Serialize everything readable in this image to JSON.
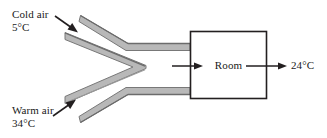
{
  "diagram": {
    "background_color": "#ffffff",
    "line_color": "#231f20",
    "duct_fill_color": "#b3b3b3",
    "duct_edge_color": "#6e6e6e",
    "labels": {
      "cold_air_name": "Cold air",
      "cold_air_temp": "5°C",
      "warm_air_name": "Warm air",
      "warm_air_temp": "34°C",
      "room": "Room",
      "outlet_temp": "24°C"
    },
    "icons": {
      "cold_inlet_arrow": "arrow-down-right-icon",
      "warm_inlet_arrow": "arrow-up-right-icon",
      "room_inlet_arrow": "arrow-right-icon",
      "room_outlet_arrow": "arrow-right-icon"
    },
    "shapes": {
      "room_box": "rectangle",
      "upper_duct": "bent-duct",
      "lower_duct": "bent-duct",
      "splitter": "v-wedge"
    }
  }
}
